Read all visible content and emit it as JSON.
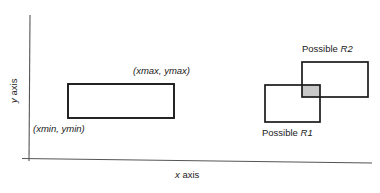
{
  "figure": {
    "type": "geometric-diagram",
    "background_color": "#ffffff",
    "stroke_color": "#1a1a1a",
    "axis_color": "#555555",
    "shaded_fill_color": "#c8c8c8"
  },
  "axes": {
    "x_axis_label_prefix": "x",
    "x_axis_label_suffix": " axis",
    "y_axis_label_prefix": "y",
    "y_axis_label_suffix": " axis"
  },
  "bounding_box": {
    "max_corner_label": "(xmax, ymax)",
    "min_corner_label": "(xmin, ymin)"
  },
  "rectangles": {
    "r1_label_prefix": "Possible ",
    "r1_label_name": "R1",
    "r2_label_prefix": "Possible ",
    "r2_label_name": "R2"
  }
}
